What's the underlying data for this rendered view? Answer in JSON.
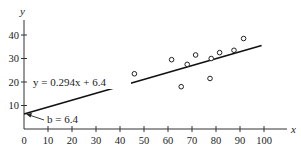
{
  "chart_data": {
    "type": "scatter",
    "title": "",
    "xlabel": "x",
    "ylabel": "y",
    "xlim": [
      0,
      110
    ],
    "ylim": [
      0,
      45
    ],
    "x_ticks": [
      0,
      10,
      20,
      30,
      40,
      50,
      60,
      70,
      80,
      90,
      100
    ],
    "y_ticks": [
      10,
      20,
      30,
      40
    ],
    "grid": false,
    "series": [
      {
        "name": "data points",
        "marker": "open-circle",
        "points": [
          {
            "x": 46,
            "y": 23.5
          },
          {
            "x": 61.5,
            "y": 29.5
          },
          {
            "x": 68,
            "y": 27.5
          },
          {
            "x": 65.5,
            "y": 18
          },
          {
            "x": 71.5,
            "y": 31.5
          },
          {
            "x": 78,
            "y": 30
          },
          {
            "x": 77.5,
            "y": 21.5
          },
          {
            "x": 81.5,
            "y": 32.5
          },
          {
            "x": 87.5,
            "y": 33.5
          },
          {
            "x": 91.5,
            "y": 38.5
          }
        ]
      },
      {
        "name": "regression line",
        "type": "line",
        "slope": 0.294,
        "intercept": 6.4,
        "x_range": [
          0,
          99
        ]
      }
    ],
    "annotations": [
      {
        "text": "y = 0.294x + 6.4",
        "position": "left of line near y=20"
      },
      {
        "text": "b = 6.4",
        "arrow_to": [
          0,
          6.4
        ]
      }
    ]
  },
  "labels": {
    "y_axis": "y",
    "x_axis": "x",
    "equation": "y = 0.294x + 6.4",
    "intercept": "b = 6.4",
    "x_tick_labels": [
      "0",
      "10",
      "20",
      "30",
      "40",
      "50",
      "60",
      "70",
      "80",
      "90",
      "100"
    ],
    "y_tick_labels": [
      "10",
      "20",
      "30",
      "40"
    ]
  }
}
